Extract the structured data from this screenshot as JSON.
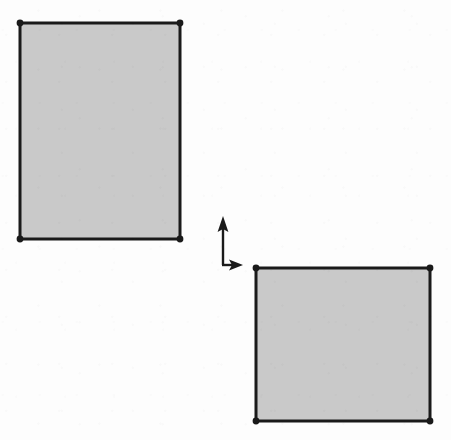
{
  "figure": {
    "background_color": "#fdfdfd",
    "stroke_color": "#1a1a1a",
    "fill_color": "#c9c9c9",
    "canvas": {
      "width": 451,
      "height": 440
    }
  },
  "shapes": [
    {
      "name": "upper-left-rectangle",
      "label": "Rectangle 1",
      "orientation": "portrait",
      "fill": "#c9c9c9",
      "stroke": "#1a1a1a",
      "stroke_width": 3,
      "x": 20,
      "y": 23,
      "width": 160,
      "height": 216,
      "vertices": [
        {
          "name": "top-left",
          "x": 20,
          "y": 23
        },
        {
          "name": "top-right",
          "x": 180,
          "y": 23
        },
        {
          "name": "bottom-right",
          "x": 180,
          "y": 239
        },
        {
          "name": "bottom-left",
          "x": 20,
          "y": 239
        }
      ]
    },
    {
      "name": "lower-right-rectangle",
      "label": "Rectangle 2",
      "orientation": "landscape",
      "fill": "#c9c9c9",
      "stroke": "#1a1a1a",
      "stroke_width": 3,
      "x": 256,
      "y": 268,
      "width": 174,
      "height": 153,
      "vertices": [
        {
          "name": "top-left",
          "x": 256,
          "y": 268
        },
        {
          "name": "top-right",
          "x": 430,
          "y": 268
        },
        {
          "name": "bottom-right",
          "x": 430,
          "y": 421
        },
        {
          "name": "bottom-left",
          "x": 256,
          "y": 421
        }
      ]
    }
  ],
  "axis_indicator": {
    "name": "coordinate-axis-indicator",
    "origin": {
      "x": 223,
      "y": 265
    },
    "stroke": "#1a1a1a",
    "stroke_width": 2,
    "vertical_axis": {
      "name": "y-axis-arrow",
      "direction": "up",
      "tip": {
        "x": 223,
        "y": 216
      },
      "length": 49
    },
    "horizontal_axis": {
      "name": "x-axis-arrow",
      "direction": "right",
      "tip": {
        "x": 243,
        "y": 265
      },
      "length": 20
    }
  },
  "vertex_marker": {
    "name": "vertex-dot",
    "shape": "filled-circle",
    "radius": 3.4,
    "color": "#1a1a1a"
  }
}
